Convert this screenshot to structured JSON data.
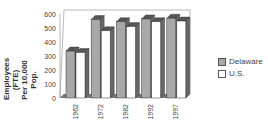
{
  "chart_data": {
    "type": "bar",
    "title": "",
    "xlabel": "",
    "ylabel": "Employees (FTE) Per 10,000 Pop.",
    "categories": [
      "1962",
      "1972",
      "1982",
      "1992",
      "1997"
    ],
    "series": [
      {
        "name": "Delaware",
        "color": "#a8a8a8",
        "values": [
          335,
          560,
          545,
          565,
          570
        ]
      },
      {
        "name": "U.S.",
        "color": "#ffffff",
        "values": [
          325,
          480,
          510,
          545,
          550
        ]
      }
    ],
    "ylim": [
      0,
      600
    ],
    "yticks": [
      0,
      100,
      200,
      300,
      400,
      500,
      600
    ],
    "grid": false,
    "legend_position": "right",
    "style": "3d-bar"
  },
  "legend": {
    "items": [
      "Delaware",
      "U.S."
    ]
  },
  "ylabel_line1": "Employees (FTE)",
  "ylabel_line2": "Per 10,000 Pop."
}
